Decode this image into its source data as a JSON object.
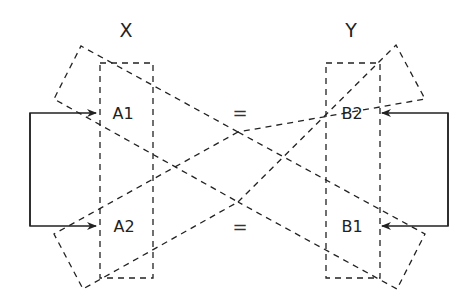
{
  "diagram": {
    "left_group": {
      "title": "X",
      "items": [
        "A1",
        "A2"
      ]
    },
    "right_group": {
      "title": "Y",
      "items": [
        "B2",
        "B1"
      ]
    },
    "equals": [
      "=",
      "="
    ],
    "colors": {
      "line": "#222222",
      "background": "#ffffff"
    }
  }
}
